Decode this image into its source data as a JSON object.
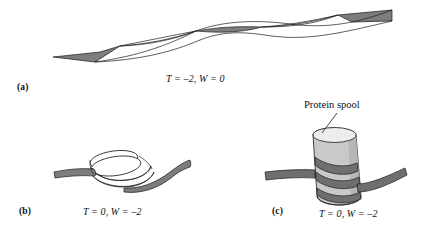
{
  "figure": {
    "background_color": "#ffffff",
    "ribbon_fill": "#808080",
    "ribbon_stroke": "#1a1a1a",
    "spool_body_color": "#c9c9c9",
    "spool_top_color": "#ededed",
    "panels": [
      {
        "id": "a",
        "label": "(a)",
        "formula": "T = –2, W = 0",
        "twist": -2,
        "writhe": 0,
        "description": "twisted-ribbon"
      },
      {
        "id": "b",
        "label": "(b)",
        "formula": "T = 0, W = –2",
        "twist": 0,
        "writhe": -2,
        "description": "coiled-ribbon"
      },
      {
        "id": "c",
        "label": "(c)",
        "formula": "T = 0, W = –2",
        "twist": 0,
        "writhe": -2,
        "description": "ribbon-wrapped-protein-spool"
      }
    ],
    "annotations": [
      {
        "id": "protein-spool",
        "text": "Protein spool"
      }
    ]
  }
}
